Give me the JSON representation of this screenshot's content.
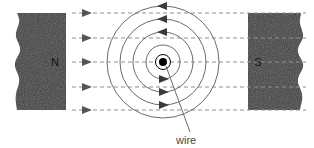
{
  "figure": {
    "width": 314,
    "height": 148,
    "background": "#ffffff"
  },
  "magnets": {
    "left": {
      "pole_label": "N",
      "name": "north-pole",
      "fill": "#3f3f3f",
      "x": 14,
      "y": 13,
      "width": 52,
      "height": 97,
      "label_x": 55,
      "label_y": 66,
      "broken_edge": "left"
    },
    "right": {
      "pole_label": "S",
      "name": "south-pole",
      "fill": "#3f3f3f",
      "x": 248,
      "y": 13,
      "width": 57,
      "height": 97,
      "label_x": 256,
      "label_y": 66,
      "broken_edge": "right"
    }
  },
  "field_lines": {
    "name": "uniform-magnet-field-lines",
    "color": "#8f8f8f",
    "dash": "4 3",
    "direction": "left-to-right",
    "x_start": 72,
    "x_end": 306,
    "arrow_x": 86,
    "arrow_color": "#555555",
    "y_values": [
      13,
      38,
      62,
      87,
      110
    ],
    "count": 5
  },
  "wire_field_circles": {
    "name": "wire-circular-field-lines",
    "center_x": 163,
    "center_y": 62,
    "color": "#6b6b6b",
    "circulation": "clockwise",
    "radii": [
      17,
      30,
      43,
      56
    ],
    "arrows": [
      {
        "radius": 17,
        "angle_deg": 90,
        "dir": "right"
      },
      {
        "radius": 30,
        "angle_deg": 90,
        "dir": "right"
      },
      {
        "radius": 43,
        "angle_deg": 90,
        "dir": "right"
      },
      {
        "radius": 30,
        "angle_deg": 270,
        "dir": "left"
      },
      {
        "radius": 43,
        "angle_deg": 270,
        "dir": "left"
      },
      {
        "radius": 56,
        "angle_deg": 270,
        "dir": "left"
      }
    ]
  },
  "wire": {
    "name": "wire-cross-section",
    "dot_radius": 4,
    "ring_radius": 7.5,
    "dot_color": "#000000",
    "ring_color": "#000000",
    "label": "wire",
    "label_x": 176,
    "label_y": 144,
    "leader": {
      "x1": 166,
      "y1": 66,
      "x2": 190,
      "y2": 132,
      "color": "#6b6b6b"
    }
  }
}
